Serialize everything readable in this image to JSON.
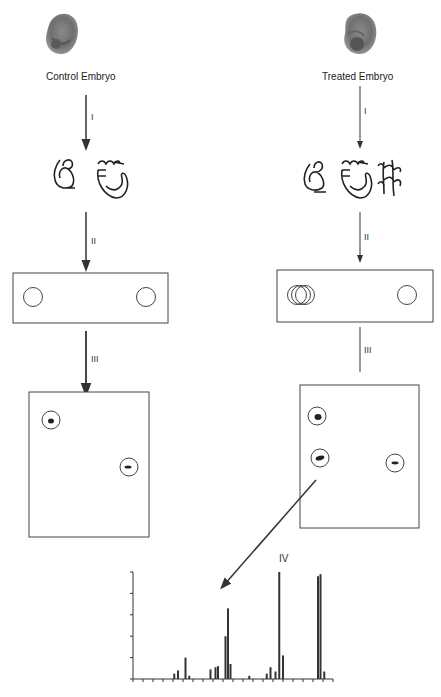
{
  "left_column": {
    "title": "Control Embryo",
    "steps": [
      "I",
      "II",
      "III"
    ],
    "gel_strip_spots": 2,
    "plate_spots": 2
  },
  "right_column": {
    "title": "Treated Embryo",
    "steps": [
      "I",
      "II",
      "III"
    ],
    "gel_strip_spots": 2,
    "plate_spots": 3
  },
  "final_step": {
    "label": "IV"
  },
  "colors": {
    "line": "#333333",
    "embryo": "#7a7a7a",
    "background": "#ffffff"
  },
  "chart_data": {
    "type": "bar",
    "title": "",
    "xlabel": "",
    "ylabel": "",
    "x_ticks_count": 20,
    "y_ticks_count": 5,
    "ylim": [
      0,
      5
    ],
    "peaks": [
      {
        "x_rel": 0.33,
        "value": 0.25
      },
      {
        "x_rel": 0.36,
        "value": 0.4
      },
      {
        "x_rel": 0.42,
        "value": 1.0
      },
      {
        "x_rel": 0.45,
        "value": 0.15
      },
      {
        "x_rel": 0.62,
        "value": 0.45
      },
      {
        "x_rel": 0.66,
        "value": 0.55
      },
      {
        "x_rel": 0.68,
        "value": 0.6
      },
      {
        "x_rel": 0.74,
        "value": 2.0
      },
      {
        "x_rel": 0.76,
        "value": 3.3
      },
      {
        "x_rel": 0.78,
        "value": 0.7
      },
      {
        "x_rel": 0.93,
        "value": 0.15
      },
      {
        "x_rel": 1.07,
        "value": 0.25
      },
      {
        "x_rel": 1.1,
        "value": 0.55
      },
      {
        "x_rel": 1.14,
        "value": 0.35
      },
      {
        "x_rel": 1.17,
        "value": 5.0
      },
      {
        "x_rel": 1.2,
        "value": 1.1
      },
      {
        "x_rel": 1.48,
        "value": 4.8
      },
      {
        "x_rel": 1.5,
        "value": 4.9
      },
      {
        "x_rel": 1.53,
        "value": 0.35
      }
    ]
  }
}
